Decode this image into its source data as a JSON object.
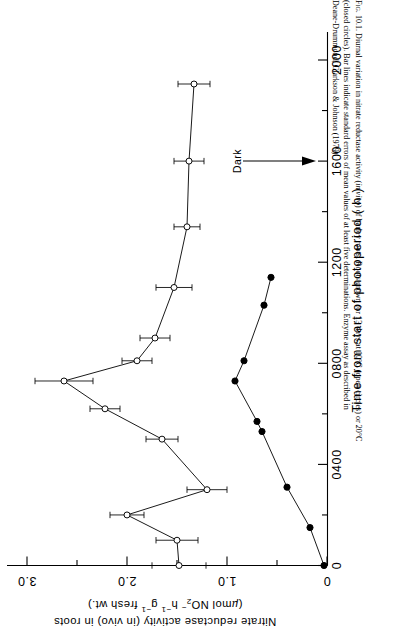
{
  "figure": {
    "label": "Fig. 10.1.",
    "caption_lines": [
      "Fig. 10.1. Diurnal variation in nitrate reductase activity (in vivo) of barley roots. Roots grown for 13 days at 10°C (open circles) or 20°C",
      "(closed circles). Bar lines indicate standard errors of mean values of at least five determinations. Enzyme assay as described in",
      "Deane-Drummond, Clarkson & Johnson (1979)."
    ]
  },
  "chart_data": {
    "type": "scatter",
    "title": "Diurnal variation in nitrate reductase activity (in vivo) of barley roots",
    "orientation": "rotated-90-clockwise",
    "xlabel": "Time from start of photoperiod  ( h )",
    "ylabel_line1": "Nitrate reductase activity (in vivo) in roots",
    "ylabel_line2": "(µmol NO₂⁻ h⁻¹ g⁻¹ fresh wt.)",
    "xlim": [
      0,
      2150
    ],
    "ylim": [
      0,
      3.2
    ],
    "xticks": [
      0,
      400,
      800,
      1200,
      1600,
      2000
    ],
    "xticklabels": [
      "0",
      "0400",
      "0800",
      "1200",
      "1600",
      "2000"
    ],
    "xminorticks": [
      200,
      600,
      1000,
      1400,
      1800
    ],
    "yticks": [
      0,
      1.0,
      2.0,
      3.0
    ],
    "yticklabels": [
      "0",
      "1.0",
      "2.0",
      "3.0"
    ],
    "yminorticks": [
      0.5,
      1.5,
      2.5
    ],
    "grid": false,
    "legend": "none",
    "annotations": [
      {
        "name": "dark-marker",
        "text": "Dark",
        "x": 1600,
        "y": 1.05,
        "arrow": "to-axis"
      }
    ],
    "series": [
      {
        "name": "10 °C (open circles)",
        "marker": "open-circle",
        "x": [
          0,
          100,
          200,
          300,
          500,
          620,
          730,
          810,
          900,
          1100,
          1340,
          1600,
          1905
        ],
        "y": [
          1.48,
          1.5,
          2.0,
          1.2,
          1.65,
          2.22,
          2.63,
          1.9,
          1.72,
          1.53,
          1.4,
          1.38,
          1.33
        ],
        "yerr": [
          0.27,
          0.21,
          0.17,
          0.2,
          0.16,
          0.15,
          0.29,
          0.15,
          0.15,
          0.18,
          0.13,
          0.15,
          0.16
        ]
      },
      {
        "name": "20 °C (closed circles)",
        "marker": "closed-circle",
        "x": [
          0,
          150,
          310,
          530,
          570,
          730,
          810,
          1030,
          1140
        ],
        "y": [
          0.03,
          0.17,
          0.4,
          0.65,
          0.7,
          0.92,
          0.83,
          0.63,
          0.56
        ],
        "yerr": [
          0,
          0,
          0,
          0,
          0,
          0,
          0,
          0,
          0
        ]
      }
    ]
  }
}
